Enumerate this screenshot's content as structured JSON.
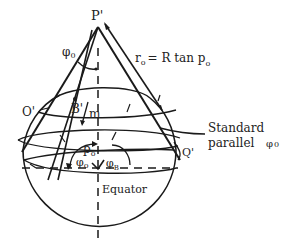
{
  "diagram": {
    "type": "conic-projection-geometry",
    "colors": {
      "ink": "#1a1a1a",
      "background": "#ffffff"
    },
    "labels": {
      "apex": "P'",
      "phi0_top": "φ",
      "phi0_top_sub": "0",
      "r0_formula_r": "r",
      "r0_formula_sub": "o",
      "r0_formula_rest": "= R tan p",
      "r0_formula_rest_sub": "o",
      "point_o": "O'",
      "point_b": "B'",
      "m": "m",
      "p0": "p",
      "p0_sub": "o",
      "phi0_bottom": "φ",
      "phi0_bottom_sub": "o",
      "phi_b": "φ",
      "phi_b_sub": "B",
      "point_q": "Q'",
      "equator": "Equator",
      "standard_parallel_line1": "Standard",
      "standard_parallel_line2": "parallel",
      "standard_parallel_phi": "φ",
      "standard_parallel_phi_sub": "0"
    }
  }
}
